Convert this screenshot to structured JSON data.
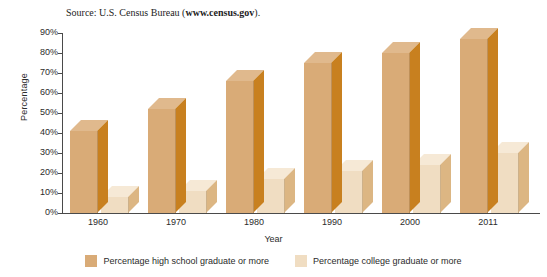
{
  "source_note": {
    "prefix": "Source: U.S. Census Bureau (",
    "link": "www.census.gov",
    "suffix": ")."
  },
  "colors": {
    "series_hs_front": "#d9ab77",
    "series_hs_side": "#c8801f",
    "series_hs_top": "#e0b98d",
    "series_college_front": "#f0ddc2",
    "series_college_side": "#dcb683",
    "series_college_top": "#f6e9d6",
    "axis": "#4a4a4a",
    "text": "#2b2b2b",
    "background": "#ffffff"
  },
  "chart_data": {
    "type": "bar",
    "title": "",
    "subtitle": "",
    "xlabel": "Year",
    "ylabel": "Percentage",
    "categories": [
      "1960",
      "1970",
      "1980",
      "1990",
      "2000",
      "2011"
    ],
    "series": [
      {
        "name": "Percentage high school graduate or more",
        "color": "#d9ab77",
        "values": [
          41,
          52,
          66,
          75,
          80,
          87
        ]
      },
      {
        "name": "Percentage college graduate or more",
        "color": "#f0ddc2",
        "values": [
          8,
          11,
          17,
          21,
          24,
          30
        ]
      }
    ],
    "ylim": [
      0,
      90
    ],
    "yticks": [
      "0%",
      "10%",
      "20%",
      "30%",
      "40%",
      "50%",
      "60%",
      "70%",
      "80%",
      "90%"
    ],
    "ytick_values": [
      0,
      10,
      20,
      30,
      40,
      50,
      60,
      70,
      80,
      90
    ],
    "grid": false,
    "legend_position": "bottom",
    "three_d": true
  },
  "legend": [
    {
      "label": "Percentage high school graduate or more",
      "color": "#d9ab77"
    },
    {
      "label": "Percentage college graduate or more",
      "color": "#f0ddc2"
    }
  ]
}
